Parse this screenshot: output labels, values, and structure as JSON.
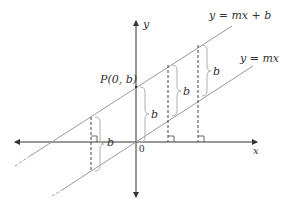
{
  "diagram": {
    "colors": {
      "axis": "#333333",
      "line": "#9a9a9a",
      "dashed": "#444444",
      "brace": "#b0b0b0",
      "text": "#333333"
    },
    "axes": {
      "x_label": "x",
      "y_label": "y",
      "origin_label": "0"
    },
    "lines": [
      {
        "label": "y = mx + b",
        "role": "shifted line"
      },
      {
        "label": "y = mx",
        "role": "base line through origin"
      }
    ],
    "point": {
      "label": "P(0, b)"
    },
    "shift_labels": [
      "b",
      "b",
      "b",
      "b"
    ],
    "right_angle_markers": 3
  }
}
